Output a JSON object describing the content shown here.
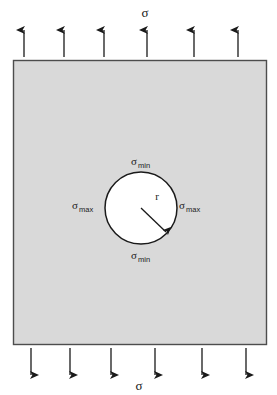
{
  "diagram": {
    "plate": {
      "fill_color": "#d9d9d9",
      "stroke_color": "#4d4d4d",
      "x": 13,
      "y": 60,
      "width": 254,
      "height": 285
    },
    "hole": {
      "fill_color": "#ffffff",
      "stroke_color": "#1a1a1a",
      "center_x": 141,
      "center_y": 208,
      "radius": 36
    },
    "labels": {
      "applied_stress_top": "σ",
      "applied_stress_bottom": "σ",
      "sigma_symbol": "σ",
      "min_subscript": "min",
      "max_subscript": "max",
      "radius": "r",
      "hole_top": "σmin",
      "hole_bottom": "σmin",
      "hole_left": "σmax",
      "hole_right": "σmax"
    },
    "arrows": {
      "color": "#1a1a1a",
      "top_direction": "up",
      "bottom_direction": "down",
      "top_x_positions": [
        24,
        64,
        104,
        147,
        194,
        238
      ],
      "bottom_x_positions": [
        31,
        70,
        111,
        155,
        202,
        246
      ],
      "top_y_start": 57,
      "top_y_end": 27,
      "bottom_y_start": 348,
      "bottom_y_end": 378
    },
    "radius_arrow": {
      "from_x": 141,
      "from_y": 208,
      "to_x": 167,
      "to_y": 233
    }
  }
}
